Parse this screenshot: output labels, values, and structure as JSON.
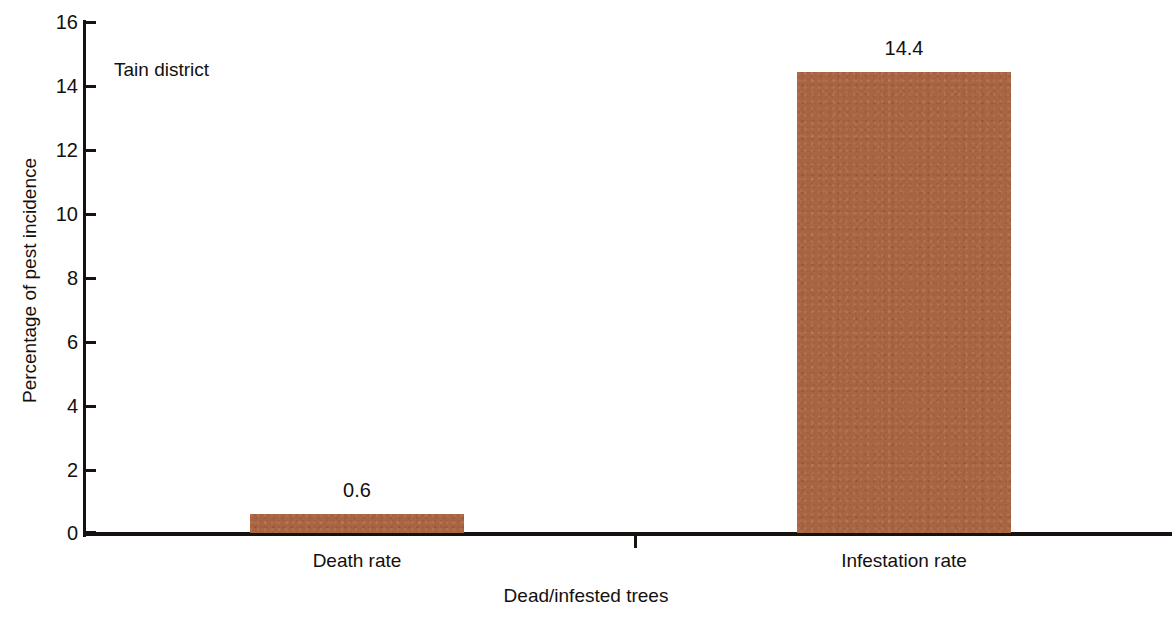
{
  "chart_data": {
    "type": "bar",
    "title": "",
    "subtitle": "",
    "annotation": "Tain district",
    "categories": [
      "Death rate",
      "Infestation rate"
    ],
    "values": [
      0.6,
      14.4
    ],
    "data_labels": [
      "0.6",
      "14.4"
    ],
    "xlabel": "Dead/infested trees",
    "ylabel": "Percentage of pest incidence",
    "ylim": [
      0,
      16
    ],
    "yticks": [
      0,
      2,
      4,
      6,
      8,
      10,
      12,
      14,
      16
    ],
    "ytick_labels": [
      "0",
      "2",
      "4",
      "6",
      "8",
      "10",
      "12",
      "14",
      "16"
    ],
    "grid": false,
    "legend": false,
    "legend_position": "none",
    "bar_color": "#a96442",
    "axis_color": "#17120f",
    "text_color": "#14100e",
    "background": "#ffffff"
  }
}
